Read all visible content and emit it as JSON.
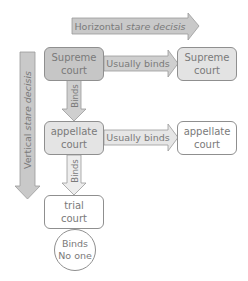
{
  "diagram": {
    "axes": {
      "horizontal": {
        "label_plain": "Horizontal ",
        "label_italic": "stare decisis"
      },
      "vertical": {
        "label_plain": "Vertical ",
        "label_italic": "stare decisis"
      }
    },
    "nodes": {
      "supreme_left": {
        "line1": "Supreme",
        "line2": "court"
      },
      "supreme_right": {
        "line1": "Supreme",
        "line2": "court"
      },
      "appellate_left": {
        "line1": "appellate",
        "line2": "court"
      },
      "appellate_right": {
        "line1": "appellate",
        "line2": "court"
      },
      "trial": {
        "line1": "trial",
        "line2": "court"
      },
      "binds_no_one": {
        "line1": "Binds",
        "line2": "No one"
      }
    },
    "edges": {
      "supreme_to_supreme": "Usually binds",
      "appellate_to_appellate": "Usually binds",
      "supreme_to_appellate": "Binds",
      "appellate_to_trial": "Binds"
    },
    "colors": {
      "dark_fill": "#c4c4c4",
      "medium_fill": "#d6d6d6",
      "light_fill": "#ececec",
      "white_fill": "#ffffff",
      "stroke": "#8f8f8f",
      "text": "#7a7a7a"
    }
  }
}
